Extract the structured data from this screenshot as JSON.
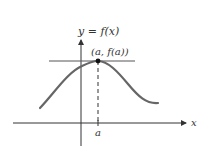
{
  "figure": {
    "function_label": "y = f(x)",
    "point_label": "(a, f(a))",
    "x_axis_label": "x",
    "tick_label": "a",
    "colors": {
      "curve": "#666666",
      "axes": "#333333",
      "tangent": "#555555",
      "point": "#111111",
      "text": "#333333"
    }
  }
}
